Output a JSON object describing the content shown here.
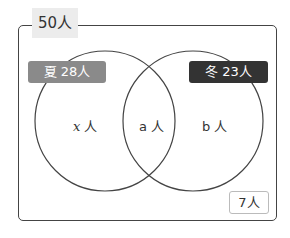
{
  "diagram": {
    "type": "venn",
    "universal": {
      "label": "50人",
      "total": 50
    },
    "sets": [
      {
        "name": "夏",
        "label": "夏 28人",
        "count": 28,
        "color": "#8a8a8a"
      },
      {
        "name": "冬",
        "label": "冬 23人",
        "count": 23,
        "color": "#333333"
      }
    ],
    "regions": {
      "only_summer": {
        "var": "x",
        "unit": "人"
      },
      "both": {
        "label": "a 人"
      },
      "only_winter": {
        "label": "b 人"
      },
      "neither": {
        "label": "7人",
        "count": 7
      }
    }
  }
}
